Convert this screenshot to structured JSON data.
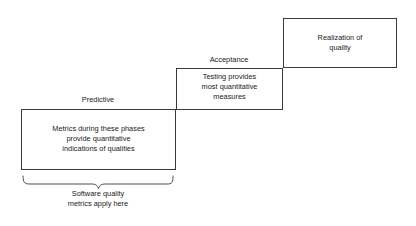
{
  "diagram": {
    "title_text_absent": "",
    "boxes": [
      {
        "id": "predictive",
        "stage_label": "Predictive",
        "body": "Metrics during these phases\nprovide quantitative\nindications of qualities"
      },
      {
        "id": "acceptance",
        "stage_label": "Acceptance",
        "body": "Testing provides\nmost quantitative\nmeasures"
      },
      {
        "id": "realization",
        "stage_label": "",
        "body": "Realization of\nquality"
      }
    ],
    "brace": {
      "caption": "Software quality\nmetrics apply here"
    },
    "colors": {
      "stroke": "#3a3a3a",
      "background": "#ffffff",
      "text": "#1a1a1a"
    }
  }
}
